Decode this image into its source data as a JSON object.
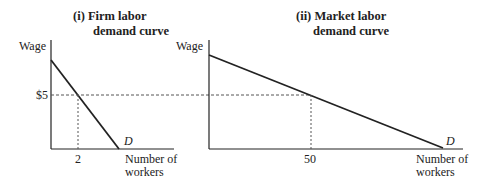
{
  "panels": [
    {
      "id": "firm",
      "title_line1": "(i)  Firm labor",
      "title_line2": "demand curve",
      "ylabel": "Wage",
      "xlabel_line1": "Number of",
      "xlabel_line2": "workers",
      "wage_tick": "$5",
      "quantity_tick": "2",
      "curve_label": "D"
    },
    {
      "id": "market",
      "title_line1": "(ii)  Market labor",
      "title_line2": "demand curve",
      "ylabel": "Wage",
      "xlabel_line1": "Number of",
      "xlabel_line2": "workers",
      "quantity_tick": "50",
      "curve_label": "D"
    }
  ],
  "colors": {
    "line": "#222222",
    "dashed": "#555555"
  }
}
